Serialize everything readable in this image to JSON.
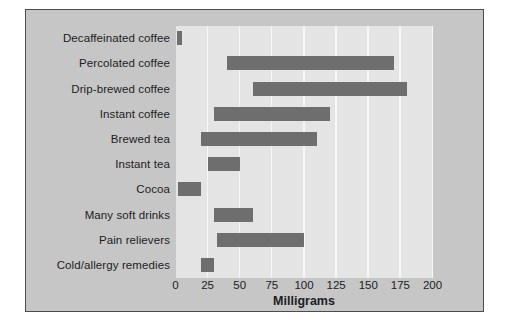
{
  "figure": {
    "panel_bg": "#c6c6c6",
    "plot_bg": "#e4e4e4",
    "bar_color": "#6e6e6e",
    "gridline_color": "#f7f7f7",
    "border_color": "#4c4c4c",
    "text_color": "#1d1d1d"
  },
  "chart_data": {
    "type": "bar",
    "orientation": "horizontal",
    "subtype": "range-bars (each bar spans a min-max interval)",
    "title": "",
    "xlabel": "Milligrams",
    "ylabel": "",
    "xlim": [
      0,
      200
    ],
    "xticks": [
      0,
      25,
      50,
      75,
      100,
      125,
      150,
      175,
      200
    ],
    "grid": "vertical white gridlines at each 25-unit tick",
    "legend": "none",
    "categories": [
      "Decaffeinated coffee",
      "Percolated coffee",
      "Drip-brewed coffee",
      "Instant coffee",
      "Brewed tea",
      "Instant tea",
      "Cocoa",
      "Many soft drinks",
      "Pain relievers",
      "Cold/allergy remedies"
    ],
    "series": [
      {
        "name": "Caffeine content range (milligrams)",
        "ranges": [
          [
            1,
            5
          ],
          [
            40,
            170
          ],
          [
            60,
            180
          ],
          [
            30,
            120
          ],
          [
            20,
            110
          ],
          [
            25,
            50
          ],
          [
            2,
            20
          ],
          [
            30,
            60
          ],
          [
            32,
            100
          ],
          [
            20,
            30
          ]
        ]
      }
    ]
  }
}
